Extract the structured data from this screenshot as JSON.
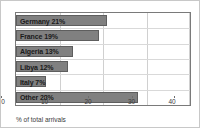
{
  "chart_data": {
    "type": "bar",
    "orientation": "horizontal",
    "title": "",
    "xlabel": "% of total arrivals",
    "ylabel": "",
    "xlim": [
      0,
      40
    ],
    "xticks": [
      0,
      10,
      20,
      30,
      40
    ],
    "grid": true,
    "legend": false,
    "bar_color": "#808080",
    "bar_edge_color": "#5e5e5e",
    "categories": [
      "Germany",
      "France",
      "Algeria",
      "Libya",
      "Italy",
      "Other"
    ],
    "values": [
      21,
      19,
      13,
      12,
      7,
      28
    ],
    "bar_labels": [
      "Germany 21%",
      "France 19%",
      "Algeria 13%",
      "Libya 12%",
      "Italy 7%",
      "Other 28%"
    ]
  },
  "axis": {
    "x_title": "% of total arrivals",
    "tick_labels": [
      "0",
      "10",
      "20",
      "30",
      "40"
    ]
  }
}
